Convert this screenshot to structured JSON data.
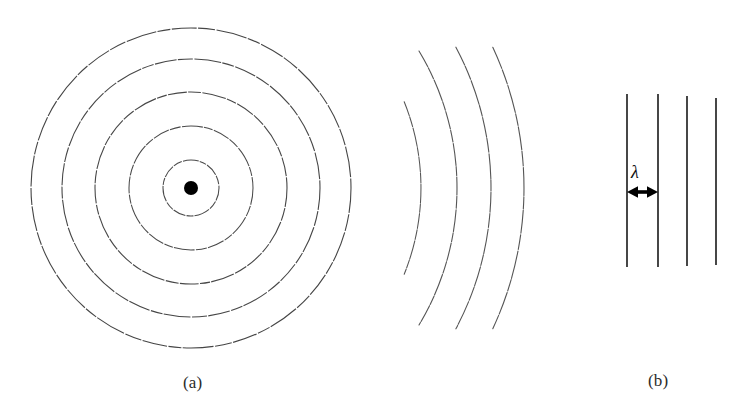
{
  "figure": {
    "kind": "wavefront-diagram",
    "background_color": "#ffffff",
    "stroke_color": "#3a3a3a",
    "bold_stroke_color": "#111111",
    "width": 745,
    "height": 412,
    "panels": [
      {
        "id": "panel-a",
        "caption": "(a)",
        "caption_x": 198,
        "caption_y": 385,
        "description": "circular wavefronts radiating from a point source",
        "source_dot": {
          "cx": 191,
          "cy": 188,
          "r": 7,
          "color": "#000000"
        },
        "circles": [
          {
            "index": 1,
            "cx": 191,
            "cy": 188,
            "r": 28
          },
          {
            "index": 2,
            "cx": 191,
            "cy": 188,
            "r": 62
          },
          {
            "index": 3,
            "cx": 191,
            "cy": 188,
            "r": 96
          },
          {
            "index": 4,
            "cx": 191,
            "cy": 188,
            "r": 129
          },
          {
            "index": 5,
            "cx": 191,
            "cy": 188,
            "r": 160
          }
        ]
      },
      {
        "id": "panel-middle",
        "caption": "",
        "description": "far-field arcs flattening toward plane waves",
        "arcs": [
          {
            "index": 1,
            "cx": 191,
            "cy": 188,
            "r": 230,
            "start_deg": -22,
            "end_deg": 22
          },
          {
            "index": 2,
            "cx": 191,
            "cy": 188,
            "r": 266,
            "start_deg": -31,
            "end_deg": 31
          },
          {
            "index": 3,
            "cx": 191,
            "cy": 188,
            "r": 300,
            "start_deg": -28,
            "end_deg": 28
          },
          {
            "index": 4,
            "cx": 191,
            "cy": 188,
            "r": 333,
            "start_deg": -25,
            "end_deg": 25
          }
        ]
      },
      {
        "id": "panel-b",
        "caption": "(b)",
        "caption_x": 660,
        "caption_y": 382,
        "description": "parallel plane wavefronts with wavelength spacing marked",
        "lines": [
          {
            "index": 1,
            "x": 627,
            "y1": 94,
            "y2": 267
          },
          {
            "index": 2,
            "x": 658,
            "y1": 94,
            "y2": 267
          },
          {
            "index": 3,
            "x": 687,
            "y1": 96,
            "y2": 266
          },
          {
            "index": 4,
            "x": 716,
            "y1": 98,
            "y2": 265
          }
        ],
        "annotation": {
          "symbol": "λ",
          "symbol_x": 638,
          "symbol_y": 177,
          "arrow_y": 192,
          "arrow_x1": 627,
          "arrow_x2": 658,
          "meaning": "wavelength"
        }
      }
    ]
  }
}
